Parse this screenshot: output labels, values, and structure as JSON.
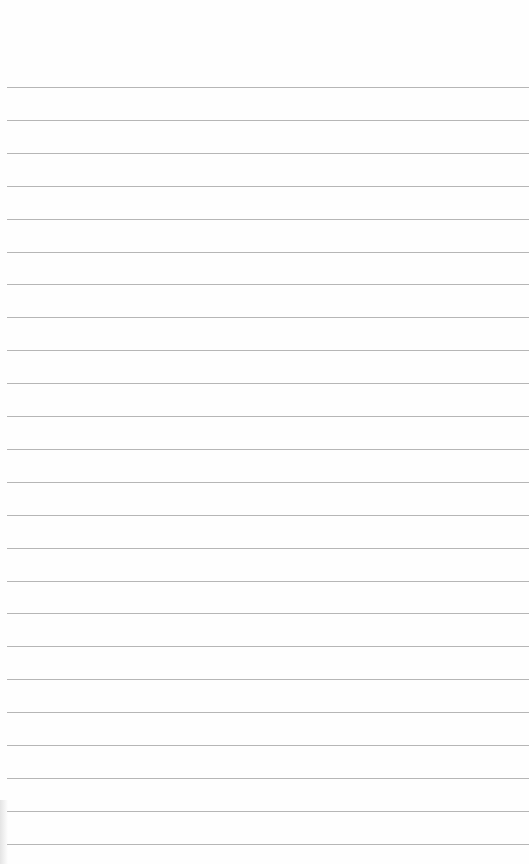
{
  "paper": {
    "type": "lined-paper",
    "background_color": "#fefefe",
    "line_color": "#a9a9a9",
    "line_count": 24,
    "first_line_y": 87,
    "line_spacing": 32.9,
    "line_left_x": 7
  }
}
